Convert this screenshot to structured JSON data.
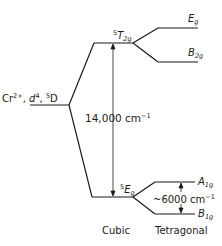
{
  "diagram": {
    "free_ion": {
      "ion": "Cr",
      "charge": "2+",
      "config": "d",
      "config_sup": "4",
      "term_sup": "5",
      "term": "D"
    },
    "cubic_upper": {
      "sup": "5",
      "main": "T",
      "sub": "2g"
    },
    "cubic_lower": {
      "sup": "5",
      "main": "E",
      "sub": "g"
    },
    "tetragonal_levels": [
      {
        "main": "E",
        "sub": "g"
      },
      {
        "main": "B",
        "sub": "2g"
      },
      {
        "main": "A",
        "sub": "1g"
      },
      {
        "main": "B",
        "sub": "1g"
      }
    ],
    "cubic_splitting": {
      "value": "14,000 cm",
      "sup": "−1"
    },
    "tetragonal_splitting": {
      "value": "~6000 cm",
      "sup": "−1"
    },
    "labels": {
      "cubic": "Cubic",
      "tetragonal": "Tetragonal"
    },
    "line_color": "#1a1a1a"
  }
}
